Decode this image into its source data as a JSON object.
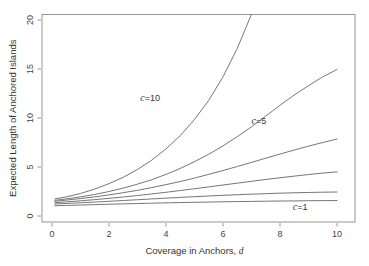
{
  "chart_data": {
    "type": "line",
    "title": "",
    "xlabel": "Coverage in Anchors, d",
    "xlabel_plain": "Coverage in Anchors,",
    "xlabel_italic": "d",
    "ylabel": "Expected Length of Anchored Islands",
    "xlim": [
      0,
      10.4
    ],
    "ylim": [
      0,
      20.6
    ],
    "xticks": [
      0,
      2,
      4,
      6,
      8,
      10
    ],
    "xtick_labels": [
      "0",
      "2",
      "4",
      "6",
      "8",
      "10"
    ],
    "yticks": [
      0,
      5,
      10,
      15,
      20
    ],
    "ytick_labels": [
      "0",
      "5",
      "10",
      "15",
      "20"
    ],
    "grid": false,
    "legend": "inline-annotations",
    "line_color": "#666666",
    "frame_color": "#8a8a8a",
    "x": [
      0.1,
      0.5,
      1,
      1.5,
      2,
      2.5,
      3,
      3.5,
      4,
      4.5,
      5,
      5.5,
      6,
      6.5,
      7,
      7.5,
      8,
      8.5,
      9,
      9.5,
      10
    ],
    "series": [
      {
        "name": "c=10",
        "label": "c=10",
        "label_c": "c",
        "label_rest": "=10",
        "label_x": 3.1,
        "label_y": 11.7,
        "values": [
          1.75,
          1.95,
          2.3,
          2.75,
          3.3,
          3.95,
          4.75,
          5.7,
          6.85,
          8.2,
          9.85,
          11.8,
          14.2,
          17.1,
          20.6,
          null,
          null,
          null,
          null,
          null,
          null
        ]
      },
      {
        "name": "c=5",
        "label": "c=5",
        "label_c": "c",
        "label_rest": "=5",
        "label_x": 7.0,
        "label_y": 9.4,
        "values": [
          1.6,
          1.75,
          1.95,
          2.2,
          2.5,
          2.85,
          3.25,
          3.7,
          4.25,
          4.85,
          5.55,
          6.3,
          7.15,
          8.1,
          9.1,
          10.2,
          11.3,
          12.35,
          13.3,
          14.2,
          14.95
        ]
      },
      {
        "name": "curve-3",
        "label": "",
        "values": [
          1.5,
          1.62,
          1.78,
          1.95,
          2.15,
          2.38,
          2.62,
          2.9,
          3.2,
          3.52,
          3.87,
          4.25,
          4.64,
          5.05,
          5.47,
          5.9,
          6.32,
          6.73,
          7.13,
          7.5,
          7.85
        ]
      },
      {
        "name": "curve-4",
        "label": "",
        "values": [
          1.35,
          1.44,
          1.55,
          1.67,
          1.8,
          1.94,
          2.09,
          2.25,
          2.42,
          2.6,
          2.78,
          2.97,
          3.16,
          3.35,
          3.54,
          3.73,
          3.9,
          4.07,
          4.23,
          4.38,
          4.5
        ]
      },
      {
        "name": "curve-5",
        "label": "",
        "values": [
          1.22,
          1.28,
          1.35,
          1.42,
          1.5,
          1.58,
          1.66,
          1.74,
          1.82,
          1.9,
          1.97,
          2.04,
          2.11,
          2.17,
          2.23,
          2.28,
          2.33,
          2.37,
          2.4,
          2.43,
          2.45
        ]
      },
      {
        "name": "c=1",
        "label": "c=1",
        "label_c": "c",
        "label_rest": "=1",
        "label_x": 8.45,
        "label_y": 0.6,
        "values": [
          1.05,
          1.08,
          1.12,
          1.16,
          1.2,
          1.24,
          1.27,
          1.31,
          1.34,
          1.37,
          1.4,
          1.42,
          1.45,
          1.47,
          1.49,
          1.51,
          1.53,
          1.54,
          1.56,
          1.57,
          1.58
        ]
      }
    ]
  }
}
